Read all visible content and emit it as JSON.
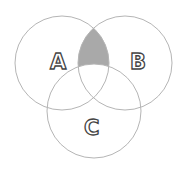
{
  "diagram": {
    "type": "venn",
    "sets": [
      {
        "label": "A",
        "cx": 62,
        "cy": 63,
        "r": 47
      },
      {
        "label": "B",
        "cx": 125,
        "cy": 63,
        "r": 47
      },
      {
        "label": "C",
        "cx": 94,
        "cy": 111,
        "r": 47
      }
    ],
    "shaded_region": "A ∩ B − C",
    "colors": {
      "stroke": "#b5b5b5",
      "shade": "#a9a9a9",
      "background": "#ffffff"
    }
  }
}
